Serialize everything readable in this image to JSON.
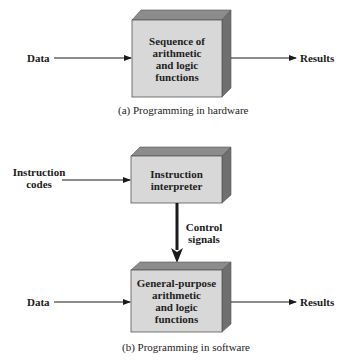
{
  "colors": {
    "front_face": "#d8d8d8",
    "top_face": "#8c8c8c",
    "side_face": "#6f6f6f",
    "line": "#1a1a1a"
  },
  "panel_a": {
    "input_label": "Data",
    "box_text": "Sequence of\narithmetic\nand logic\nfunctions",
    "output_label": "Results",
    "caption": "(a) Programming in hardware"
  },
  "panel_b": {
    "instruction_label": "Instruction\ncodes",
    "interpreter_text": "Instruction\ninterpreter",
    "control_label": "Control\nsignals",
    "input_label": "Data",
    "box_text": "General-purpose\narithmetic\nand logic\nfunctions",
    "output_label": "Results",
    "caption": "(b) Programming in software"
  }
}
